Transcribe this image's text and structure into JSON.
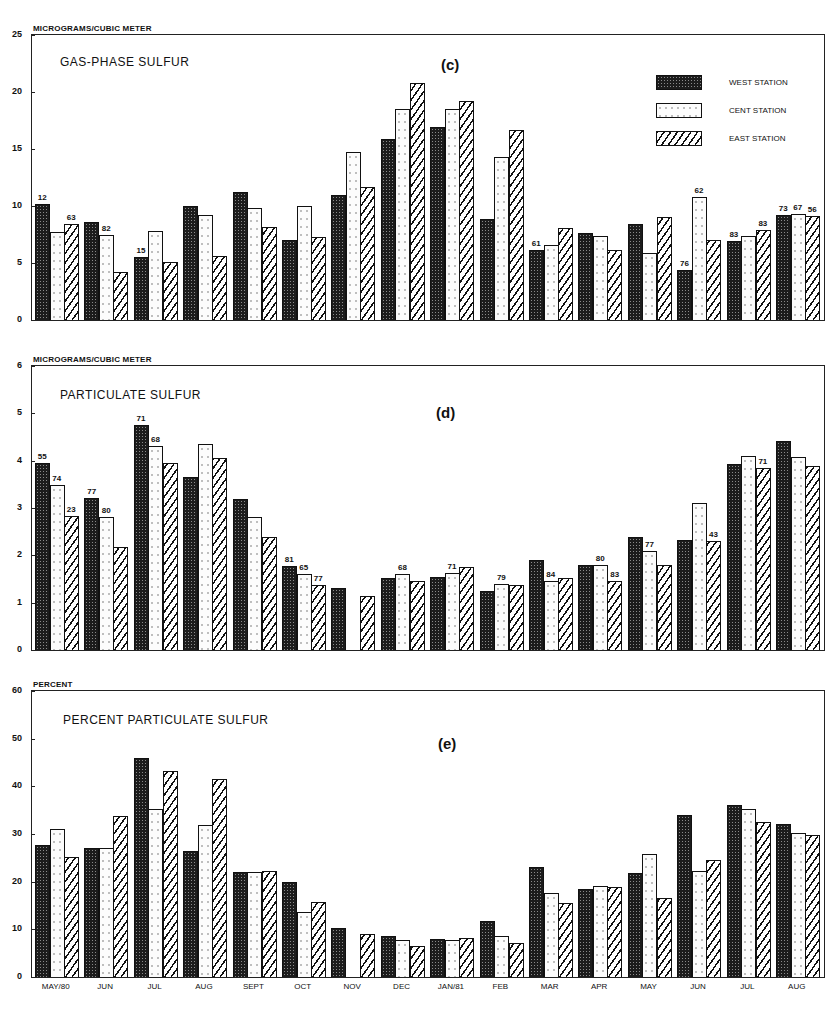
{
  "months": [
    "MAY/80",
    "JUN",
    "JUL",
    "AUG",
    "SEPT",
    "OCT",
    "NOV",
    "DEC",
    "JAN/81",
    "FEB",
    "MAR",
    "APR",
    "MAY",
    "JUN",
    "JUL",
    "AUG"
  ],
  "legend": {
    "west": "WEST STATION",
    "cent": "CENT STATION",
    "east": "EAST STATION"
  },
  "panels": {
    "c": {
      "unit": "MICROGRAMS/CUBIC METER",
      "title": "GAS-PHASE SULFUR",
      "label": "(c)",
      "ymax": 25,
      "yticks": [
        0,
        5,
        10,
        15,
        20,
        25
      ]
    },
    "d": {
      "unit": "MICROGRAMS/CUBIC METER",
      "title": "PARTICULATE SULFUR",
      "label": "(d)",
      "ymax": 6,
      "yticks": [
        0,
        1,
        2,
        3,
        4,
        5,
        6
      ]
    },
    "e": {
      "unit": "PERCENT",
      "title": "PERCENT PARTICULATE SULFUR",
      "label": "(e)",
      "ymax": 60,
      "yticks": [
        0,
        10,
        20,
        30,
        40,
        50,
        60
      ]
    }
  },
  "chart_data": [
    {
      "type": "bar",
      "title": "GAS-PHASE SULFUR",
      "panel_label": "(c)",
      "ylabel": "MICROGRAMS/CUBIC METER",
      "xlabel": "",
      "ylim": [
        0,
        25
      ],
      "grid": false,
      "legend_position": "upper right",
      "categories": [
        "MAY/80",
        "JUN",
        "JUL",
        "AUG",
        "SEPT",
        "OCT",
        "NOV",
        "DEC",
        "JAN/81",
        "FEB",
        "MAR",
        "APR",
        "MAY",
        "JUN",
        "JUL",
        "AUG"
      ],
      "series": [
        {
          "name": "WEST STATION",
          "values": [
            10.2,
            8.6,
            5.5,
            10.0,
            11.2,
            7.0,
            11.0,
            15.9,
            16.9,
            8.9,
            6.1,
            7.6,
            8.4,
            4.4,
            6.9,
            9.2
          ]
        },
        {
          "name": "CENT STATION",
          "values": [
            7.7,
            7.5,
            7.8,
            9.2,
            9.8,
            10.0,
            14.7,
            18.5,
            18.5,
            14.3,
            6.6,
            7.4,
            5.9,
            10.8,
            7.4,
            9.3
          ]
        },
        {
          "name": "EAST STATION",
          "values": [
            8.4,
            4.2,
            5.1,
            5.6,
            8.2,
            7.3,
            11.7,
            20.8,
            19.2,
            16.7,
            8.1,
            6.1,
            9.0,
            7.0,
            7.9,
            9.1
          ]
        }
      ],
      "annotations": [
        {
          "category": "MAY/80",
          "series": "WEST STATION",
          "text": "12"
        },
        {
          "category": "MAY/80",
          "series": "EAST STATION",
          "text": "63"
        },
        {
          "category": "JUN",
          "series": "CENT STATION",
          "text": "82"
        },
        {
          "category": "JUL",
          "series": "WEST STATION",
          "text": "15"
        },
        {
          "category": "MAR",
          "series": "WEST STATION",
          "text": "61"
        },
        {
          "category": "JUN",
          "index": 13,
          "series": "WEST STATION",
          "text": "76"
        },
        {
          "category": "JUN",
          "index": 13,
          "series": "CENT STATION",
          "text": "62"
        },
        {
          "category": "JUL",
          "index": 14,
          "series": "WEST STATION",
          "text": "83"
        },
        {
          "category": "JUL",
          "index": 14,
          "series": "EAST STATION",
          "text": "83"
        },
        {
          "category": "AUG",
          "index": 15,
          "series": "WEST STATION",
          "text": "73"
        },
        {
          "category": "AUG",
          "index": 15,
          "series": "CENT STATION",
          "text": "67"
        },
        {
          "category": "AUG",
          "index": 15,
          "series": "EAST STATION",
          "text": "56"
        }
      ]
    },
    {
      "type": "bar",
      "title": "PARTICULATE SULFUR",
      "panel_label": "(d)",
      "ylabel": "MICROGRAMS/CUBIC METER",
      "xlabel": "",
      "ylim": [
        0,
        6
      ],
      "grid": false,
      "categories": [
        "MAY/80",
        "JUN",
        "JUL",
        "AUG",
        "SEPT",
        "OCT",
        "NOV",
        "DEC",
        "JAN/81",
        "FEB",
        "MAR",
        "APR",
        "MAY",
        "JUN",
        "JUL",
        "AUG"
      ],
      "series": [
        {
          "name": "WEST STATION",
          "values": [
            3.95,
            3.22,
            4.75,
            3.65,
            3.2,
            1.78,
            1.3,
            1.53,
            1.55,
            1.25,
            1.9,
            1.8,
            2.38,
            2.33,
            3.93,
            4.42
          ]
        },
        {
          "name": "CENT STATION",
          "values": [
            3.48,
            2.8,
            4.32,
            4.36,
            2.8,
            1.6,
            null,
            1.6,
            1.63,
            1.4,
            1.45,
            1.8,
            2.1,
            3.1,
            4.1,
            4.08
          ]
        },
        {
          "name": "EAST STATION",
          "values": [
            2.83,
            2.18,
            3.95,
            4.05,
            2.38,
            1.38,
            1.15,
            1.45,
            1.75,
            1.38,
            1.53,
            1.45,
            1.8,
            2.3,
            3.85,
            3.88
          ]
        }
      ],
      "annotations": [
        {
          "category": "MAY/80",
          "series": "WEST STATION",
          "text": "55"
        },
        {
          "category": "MAY/80",
          "series": "CENT STATION",
          "text": "74"
        },
        {
          "category": "MAY/80",
          "series": "EAST STATION",
          "text": "23"
        },
        {
          "category": "JUN",
          "series": "WEST STATION",
          "text": "77"
        },
        {
          "category": "JUN",
          "series": "CENT STATION",
          "text": "80"
        },
        {
          "category": "JUL",
          "series": "WEST STATION",
          "text": "71"
        },
        {
          "category": "JUL",
          "series": "CENT STATION",
          "text": "68"
        },
        {
          "category": "OCT",
          "series": "WEST STATION",
          "text": "81"
        },
        {
          "category": "OCT",
          "series": "CENT STATION",
          "text": "65"
        },
        {
          "category": "OCT",
          "series": "EAST STATION",
          "text": "77"
        },
        {
          "category": "DEC",
          "series": "CENT STATION",
          "text": "68"
        },
        {
          "category": "JAN/81",
          "series": "CENT STATION",
          "text": "71"
        },
        {
          "category": "FEB",
          "series": "CENT STATION",
          "text": "79"
        },
        {
          "category": "MAR",
          "series": "CENT STATION",
          "text": "84"
        },
        {
          "category": "APR",
          "series": "CENT STATION",
          "text": "80"
        },
        {
          "category": "APR",
          "series": "EAST STATION",
          "text": "83"
        },
        {
          "category": "MAY",
          "series": "CENT STATION",
          "text": "77"
        },
        {
          "category": "JUN",
          "index": 13,
          "series": "EAST STATION",
          "text": "43"
        },
        {
          "category": "JUL",
          "index": 14,
          "series": "EAST STATION",
          "text": "71"
        }
      ]
    },
    {
      "type": "bar",
      "title": "PERCENT PARTICULATE SULFUR",
      "panel_label": "(e)",
      "ylabel": "PERCENT",
      "xlabel": "",
      "ylim": [
        0,
        60
      ],
      "grid": false,
      "categories": [
        "MAY/80",
        "JUN",
        "JUL",
        "AUG",
        "SEPT",
        "OCT",
        "NOV",
        "DEC",
        "JAN/81",
        "FEB",
        "MAR",
        "APR",
        "MAY",
        "JUN",
        "JUL",
        "AUG"
      ],
      "series": [
        {
          "name": "WEST STATION",
          "values": [
            27.8,
            27.0,
            46.0,
            26.5,
            22.0,
            20.0,
            10.3,
            8.5,
            8.0,
            11.8,
            23.0,
            18.5,
            21.8,
            34.0,
            36.0,
            32.2
          ]
        },
        {
          "name": "CENT STATION",
          "values": [
            31.0,
            27.1,
            35.3,
            31.8,
            22.0,
            13.7,
            null,
            7.8,
            7.8,
            8.5,
            17.7,
            19.0,
            25.8,
            22.2,
            35.3,
            30.2
          ]
        },
        {
          "name": "EAST STATION",
          "values": [
            25.1,
            33.8,
            43.3,
            41.5,
            22.3,
            15.8,
            9.0,
            6.5,
            8.1,
            7.2,
            15.5,
            18.9,
            16.5,
            24.5,
            32.5,
            29.8
          ]
        }
      ]
    }
  ]
}
